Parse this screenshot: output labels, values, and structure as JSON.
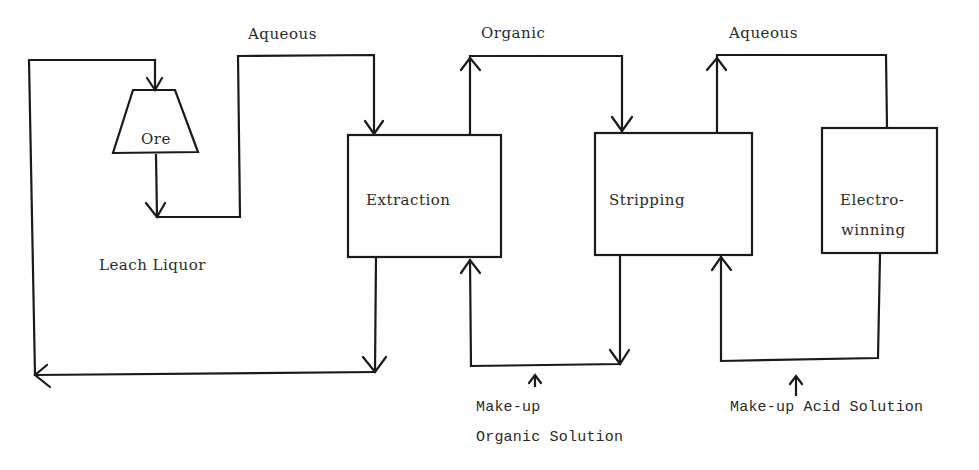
{
  "diagram": {
    "type": "process-flow",
    "nodes": {
      "ore": {
        "label": "Ore",
        "shape": "trapezoid"
      },
      "extraction": {
        "label": "Extraction",
        "shape": "rectangle"
      },
      "stripping": {
        "label": "Stripping",
        "shape": "rectangle"
      },
      "electrowinning": {
        "label_line1": "Electro-",
        "label_line2": "winning",
        "shape": "rectangle"
      }
    },
    "streams": {
      "aqueous_1": "Aqueous",
      "organic": "Organic",
      "aqueous_2": "Aqueous",
      "leach_liquor": "Leach Liquor",
      "makeup_organic_line1": "Make-up",
      "makeup_organic_line2": "Organic Solution",
      "makeup_acid": "Make-up Acid Solution"
    },
    "edges": [
      {
        "from": "ore",
        "to": "extraction",
        "label": "Aqueous"
      },
      {
        "from": "extraction",
        "to": "ore",
        "label": "Leach Liquor (raffinate recycle)"
      },
      {
        "from": "extraction",
        "to": "stripping",
        "label": "Organic"
      },
      {
        "from": "stripping",
        "to": "extraction",
        "label": "Make-up Organic Solution"
      },
      {
        "from": "electrowinning",
        "to": "stripping",
        "label": "Make-up Acid Solution"
      },
      {
        "from": "stripping",
        "to": "electrowinning",
        "label": "Aqueous"
      }
    ],
    "line_color": "#1a1a1a"
  }
}
